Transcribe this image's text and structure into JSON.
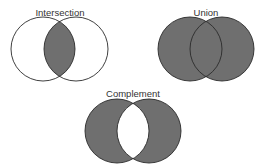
{
  "colors": {
    "fill": "#6f6f6f",
    "stroke": "#2a2a2a",
    "background": "#ffffff"
  },
  "diagrams": [
    {
      "title": "Intersection",
      "shaded_region": "A ∩ B",
      "circles": [
        {
          "cx": 43,
          "cy": 49,
          "r": 32
        },
        {
          "cx": 76,
          "cy": 49,
          "r": 32
        }
      ],
      "title_pos": {
        "x": 60,
        "y": 16
      }
    },
    {
      "title": "Union",
      "shaded_region": "A ∪ B",
      "circles": [
        {
          "cx": 190,
          "cy": 49,
          "r": 32
        },
        {
          "cx": 222,
          "cy": 49,
          "r": 32
        }
      ],
      "title_pos": {
        "x": 206,
        "y": 16
      }
    },
    {
      "title": "Complement",
      "shaded_region": "(A ∪ B) − (A ∩ B)",
      "circles": [
        {
          "cx": 117,
          "cy": 131,
          "r": 32
        },
        {
          "cx": 149,
          "cy": 131,
          "r": 32
        }
      ],
      "title_pos": {
        "x": 133,
        "y": 97
      }
    }
  ]
}
